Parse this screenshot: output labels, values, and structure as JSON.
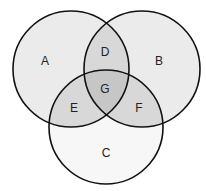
{
  "diagram": {
    "type": "venn-3-set",
    "colors": {
      "background": "#ffffff",
      "single": "#ebebeb",
      "circle_c": "#f7f7f7",
      "pair": "#d8d8d8",
      "triple": "#c6c6c6",
      "stroke": "#111111"
    },
    "circles": [
      {
        "id": "A",
        "cx": 71,
        "cy": 69,
        "r": 58
      },
      {
        "id": "B",
        "cx": 142,
        "cy": 69,
        "r": 58
      },
      {
        "id": "C",
        "cx": 106,
        "cy": 127,
        "r": 57
      }
    ],
    "regions": [
      {
        "label": "A",
        "x": 45,
        "y": 61
      },
      {
        "label": "B",
        "x": 159,
        "y": 61
      },
      {
        "label": "C",
        "x": 106,
        "y": 153
      },
      {
        "label": "D",
        "x": 105,
        "y": 52
      },
      {
        "label": "E",
        "x": 74,
        "y": 108
      },
      {
        "label": "F",
        "x": 139,
        "y": 108
      },
      {
        "label": "G",
        "x": 105,
        "y": 89
      }
    ]
  }
}
